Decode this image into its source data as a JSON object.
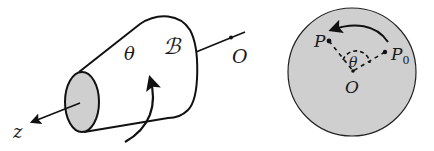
{
  "figure_left": {
    "body_label": "ℬ",
    "angle_label": "θ",
    "origin_label": "O",
    "axis_label": "z",
    "end_face_fill": "#cfcfcf"
  },
  "figure_right": {
    "point_label": "P",
    "start_point_label": "P",
    "start_point_subscript": "0",
    "angle_label": "θ",
    "origin_label": "O",
    "disk_fill": "#cfcfcf"
  },
  "colors": {
    "stroke": "#111111",
    "background": "#ffffff"
  }
}
